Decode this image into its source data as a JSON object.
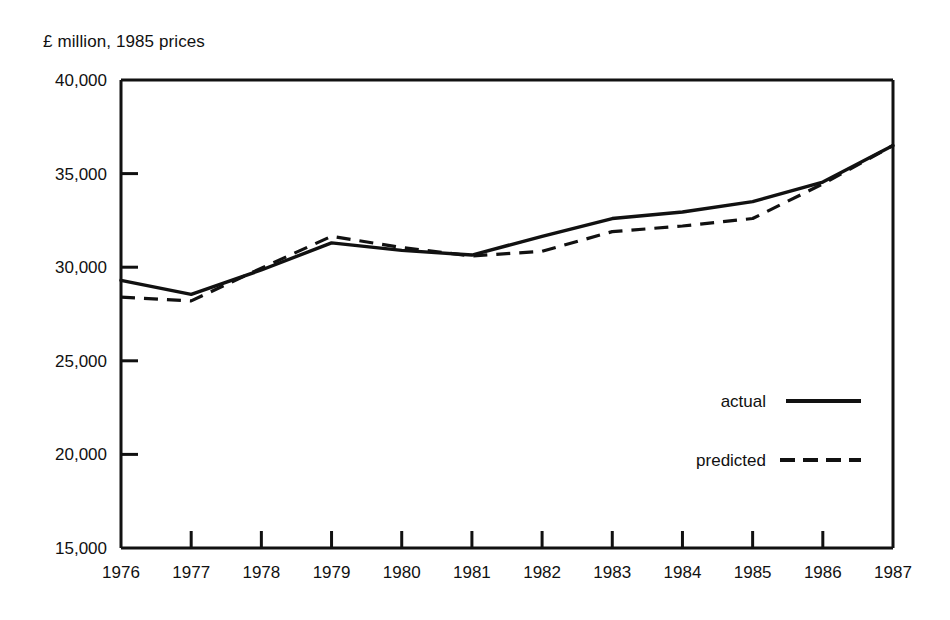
{
  "chart_data": {
    "type": "line",
    "title": "",
    "ylabel": "£ million, 1985 prices",
    "xlabel": "",
    "categories": [
      "1976",
      "1977",
      "1978",
      "1979",
      "1980",
      "1981",
      "1982",
      "1983",
      "1984",
      "1985",
      "1986",
      "1987"
    ],
    "x": [
      1976,
      1977,
      1978,
      1979,
      1980,
      1981,
      1982,
      1983,
      1984,
      1985,
      1986,
      1987
    ],
    "series": [
      {
        "name": "actual",
        "style": "solid",
        "color": "#111111",
        "values": [
          29300,
          28550,
          29850,
          31300,
          30900,
          30650,
          31650,
          32600,
          32950,
          33500,
          34550,
          36500
        ]
      },
      {
        "name": "predicted",
        "style": "dashed",
        "color": "#111111",
        "values": [
          28400,
          28200,
          29950,
          31650,
          31050,
          30600,
          30850,
          31900,
          32200,
          32600,
          34450,
          36500
        ]
      }
    ],
    "ylim": [
      15000,
      40000
    ],
    "yticks": [
      15000,
      20000,
      25000,
      30000,
      35000,
      40000
    ],
    "ytick_labels": [
      "15,000",
      "20,000",
      "25,000",
      "30,000",
      "35,000",
      "40,000"
    ],
    "xlim": [
      1976,
      1987
    ],
    "grid": false,
    "legend_position": "inside-right-lower",
    "legend": [
      {
        "label": "actual",
        "style": "solid"
      },
      {
        "label": "predicted",
        "style": "dashed"
      }
    ]
  },
  "axes": {
    "y_title": "£ million, 1985 prices",
    "y_labels": [
      "40,000",
      "35,000",
      "30,000",
      "25,000",
      "20,000",
      "15,000"
    ],
    "x_labels": [
      "1976",
      "1977",
      "1978",
      "1979",
      "1980",
      "1981",
      "1982",
      "1983",
      "1984",
      "1985",
      "1986",
      "1987"
    ]
  },
  "legend": {
    "actual_label": "actual",
    "predicted_label": "predicted"
  },
  "colors": {
    "ink": "#111111",
    "background": "#ffffff"
  }
}
